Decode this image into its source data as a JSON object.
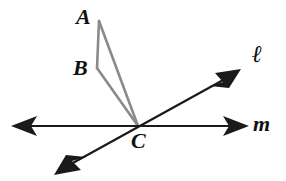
{
  "figure": {
    "kind": "geometry-diagram",
    "background_color": "#ffffff",
    "line_color": "#1a1a1a",
    "segment_color": "#8a8a8a",
    "text_color": "#111111",
    "canvas": {
      "width": 286,
      "height": 181
    }
  },
  "points": [
    {
      "id": "A",
      "label": "A",
      "x": 99,
      "y": 21,
      "label_x": 76,
      "label_y": 6
    },
    {
      "id": "B",
      "label": "B",
      "x": 97,
      "y": 68,
      "label_x": 73,
      "label_y": 57
    },
    {
      "id": "C",
      "label": "C",
      "x": 138,
      "y": 126,
      "label_x": 131,
      "label_y": 130
    }
  ],
  "segments": [
    {
      "name": "segment-AB",
      "from": "A",
      "to": "B",
      "color": "#8a8a8a",
      "width": 2.6
    },
    {
      "name": "segment-BC",
      "from": "B",
      "to": "C",
      "color": "#8a8a8a",
      "width": 2.6
    },
    {
      "name": "segment-AC",
      "from": "A",
      "to": "C",
      "color": "#8a8a8a",
      "width": 2.6
    }
  ],
  "lines": [
    {
      "name": "line-m",
      "label": "m",
      "label_x": 253,
      "label_y": 113,
      "x1": 14,
      "y1": 126,
      "x2": 246,
      "y2": 126,
      "arrows": "both",
      "color": "#1a1a1a",
      "width": 2.2
    },
    {
      "name": "line-l",
      "label": "ℓ",
      "label_x": 252,
      "label_y": 42,
      "x1": 58,
      "y1": 171,
      "x2": 238,
      "y2": 72,
      "arrows": "both",
      "color": "#1a1a1a",
      "width": 2.2
    }
  ],
  "labels": {
    "point_a": "A",
    "point_b": "B",
    "point_c": "C",
    "line_ell": "ℓ",
    "line_m": "m"
  }
}
